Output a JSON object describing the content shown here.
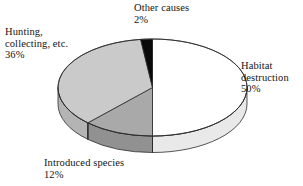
{
  "chart_data": {
    "type": "pie",
    "title": "",
    "subtitle": "",
    "xlabel": "",
    "ylabel": "",
    "legend_position": "none",
    "grid": false,
    "start_angle_deg": 0,
    "direction": "clockwise",
    "style": "3d-perspective",
    "categories": [
      "Habitat destruction",
      "Introduced species",
      "Hunting, collecting, etc.",
      "Other causes"
    ],
    "values": [
      50,
      12,
      36,
      2
    ],
    "unit": "%",
    "colors": [
      "#ffffff",
      "#a9a9a9",
      "#cacaca",
      "#0a0a0a"
    ],
    "side_colors": [
      "#e9e9e9",
      "#919191",
      "#b4b4b4",
      "#050505"
    ],
    "slices": [
      {
        "label": "Habitat destruction",
        "value": 50,
        "value_text": "50%",
        "color": "#ffffff",
        "side_color": "#e9e9e9"
      },
      {
        "label": "Introduced species",
        "value": 12,
        "value_text": "12%",
        "color": "#a9a9a9",
        "side_color": "#919191"
      },
      {
        "label": "Hunting, collecting, etc.",
        "value": 36,
        "value_text": "36%",
        "color": "#cacaca",
        "side_color": "#b4b4b4"
      },
      {
        "label": "Other causes",
        "value": 2,
        "value_text": "2%",
        "color": "#0a0a0a",
        "side_color": "#050505"
      }
    ]
  },
  "labels": {
    "other": {
      "line1": "Other causes",
      "pct": "2%"
    },
    "hunting": {
      "line1": "Hunting,",
      "line2": "collecting, etc.",
      "pct": "36%"
    },
    "habitat": {
      "line1": "Habitat",
      "line2": "destruction",
      "pct": "50%"
    },
    "introduced": {
      "line1": "Introduced species",
      "pct": "12%"
    }
  }
}
